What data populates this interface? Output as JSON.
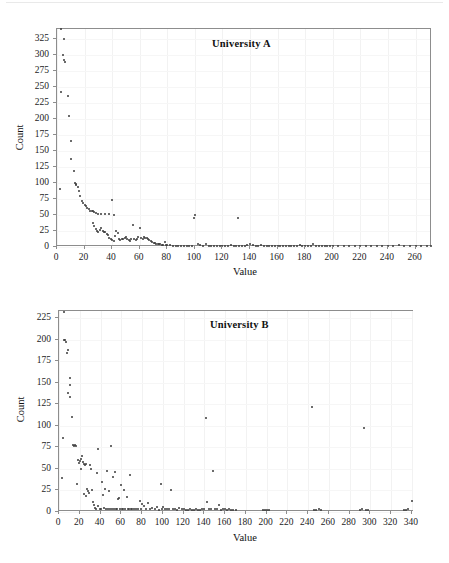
{
  "page": {
    "background": "#ffffff",
    "top_rule": "",
    "bottom_caption": ""
  },
  "chart_data": [
    {
      "id": "university-a",
      "type": "scatter",
      "title": "University A",
      "xlabel": "Value",
      "ylabel": "Count",
      "xlim": [
        0,
        272
      ],
      "ylim": [
        0,
        340
      ],
      "xticks": [
        0,
        20,
        40,
        60,
        80,
        100,
        120,
        140,
        160,
        180,
        200,
        220,
        240,
        260
      ],
      "yticks": [
        0,
        25,
        50,
        75,
        100,
        125,
        150,
        175,
        200,
        225,
        250,
        275,
        300,
        325
      ],
      "grid": "faint",
      "legend": "none",
      "marker_color": "#3a3a3a",
      "points": [
        [
          2,
          90
        ],
        [
          3,
          340
        ],
        [
          5,
          325
        ],
        [
          4,
          300
        ],
        [
          5,
          292
        ],
        [
          6,
          288
        ],
        [
          3,
          242
        ],
        [
          8,
          235
        ],
        [
          9,
          204
        ],
        [
          10,
          166
        ],
        [
          10,
          138
        ],
        [
          12,
          119
        ],
        [
          13,
          100
        ],
        [
          14,
          99
        ],
        [
          14,
          96
        ],
        [
          15,
          93
        ],
        [
          16,
          88
        ],
        [
          17,
          79
        ],
        [
          18,
          72
        ],
        [
          19,
          68
        ],
        [
          20,
          66
        ],
        [
          21,
          64
        ],
        [
          22,
          61
        ],
        [
          23,
          59
        ],
        [
          24,
          57
        ],
        [
          25,
          56
        ],
        [
          26,
          56
        ],
        [
          27,
          55
        ],
        [
          28,
          53
        ],
        [
          30,
          51
        ],
        [
          32,
          51
        ],
        [
          35,
          51
        ],
        [
          38,
          51
        ],
        [
          40,
          73
        ],
        [
          41,
          50
        ],
        [
          26,
          38
        ],
        [
          27,
          33
        ],
        [
          28,
          28
        ],
        [
          29,
          25
        ],
        [
          30,
          23
        ],
        [
          31,
          26
        ],
        [
          32,
          30
        ],
        [
          33,
          25
        ],
        [
          34,
          24
        ],
        [
          35,
          23
        ],
        [
          36,
          21
        ],
        [
          37,
          19
        ],
        [
          38,
          14
        ],
        [
          39,
          12
        ],
        [
          40,
          11
        ],
        [
          41,
          10
        ],
        [
          42,
          18
        ],
        [
          43,
          25
        ],
        [
          44,
          22
        ],
        [
          45,
          12
        ],
        [
          46,
          11
        ],
        [
          47,
          13
        ],
        [
          48,
          12
        ],
        [
          49,
          14
        ],
        [
          50,
          15
        ],
        [
          51,
          13
        ],
        [
          52,
          11
        ],
        [
          53,
          10
        ],
        [
          54,
          13
        ],
        [
          55,
          34
        ],
        [
          56,
          12
        ],
        [
          57,
          11
        ],
        [
          58,
          13
        ],
        [
          59,
          15
        ],
        [
          60,
          29
        ],
        [
          61,
          14
        ],
        [
          62,
          13
        ],
        [
          63,
          15
        ],
        [
          64,
          14
        ],
        [
          65,
          14
        ],
        [
          66,
          12
        ],
        [
          67,
          11
        ],
        [
          68,
          9
        ],
        [
          69,
          8
        ],
        [
          70,
          7
        ],
        [
          71,
          6
        ],
        [
          72,
          5
        ],
        [
          73,
          5
        ],
        [
          74,
          4
        ],
        [
          75,
          4
        ],
        [
          76,
          3
        ],
        [
          77,
          3
        ],
        [
          78,
          8
        ],
        [
          79,
          3
        ],
        [
          80,
          3
        ],
        [
          82,
          3
        ],
        [
          84,
          2
        ],
        [
          86,
          2
        ],
        [
          88,
          2
        ],
        [
          90,
          2
        ],
        [
          92,
          2
        ],
        [
          94,
          2
        ],
        [
          96,
          2
        ],
        [
          98,
          2
        ],
        [
          99,
          45
        ],
        [
          100,
          50
        ],
        [
          102,
          5
        ],
        [
          104,
          3
        ],
        [
          106,
          2
        ],
        [
          108,
          5
        ],
        [
          110,
          2
        ],
        [
          112,
          2
        ],
        [
          114,
          2
        ],
        [
          116,
          2
        ],
        [
          118,
          2
        ],
        [
          120,
          2
        ],
        [
          122,
          2
        ],
        [
          124,
          2
        ],
        [
          126,
          3
        ],
        [
          128,
          2
        ],
        [
          130,
          2
        ],
        [
          131,
          45
        ],
        [
          132,
          2
        ],
        [
          134,
          2
        ],
        [
          136,
          2
        ],
        [
          138,
          3
        ],
        [
          140,
          4
        ],
        [
          142,
          3
        ],
        [
          144,
          2
        ],
        [
          146,
          2
        ],
        [
          148,
          3
        ],
        [
          150,
          2
        ],
        [
          152,
          2
        ],
        [
          154,
          2
        ],
        [
          156,
          2
        ],
        [
          158,
          2
        ],
        [
          160,
          2
        ],
        [
          162,
          2
        ],
        [
          164,
          2
        ],
        [
          166,
          2
        ],
        [
          168,
          2
        ],
        [
          170,
          2
        ],
        [
          172,
          2
        ],
        [
          174,
          2
        ],
        [
          176,
          3
        ],
        [
          178,
          2
        ],
        [
          180,
          2
        ],
        [
          182,
          2
        ],
        [
          184,
          2
        ],
        [
          186,
          5
        ],
        [
          188,
          2
        ],
        [
          190,
          2
        ],
        [
          192,
          2
        ],
        [
          194,
          2
        ],
        [
          196,
          2
        ],
        [
          198,
          2
        ],
        [
          200,
          2
        ],
        [
          204,
          2
        ],
        [
          208,
          2
        ],
        [
          212,
          2
        ],
        [
          216,
          2
        ],
        [
          220,
          2
        ],
        [
          224,
          2
        ],
        [
          228,
          2
        ],
        [
          232,
          2
        ],
        [
          236,
          2
        ],
        [
          240,
          2
        ],
        [
          244,
          2
        ],
        [
          248,
          3
        ],
        [
          252,
          2
        ],
        [
          256,
          2
        ],
        [
          260,
          2
        ],
        [
          264,
          2
        ],
        [
          268,
          2
        ],
        [
          271,
          2
        ]
      ]
    },
    {
      "id": "university-b",
      "type": "scatter",
      "title": "University B",
      "xlabel": "Value",
      "ylabel": "Count",
      "xlim": [
        0,
        342
      ],
      "ylim": [
        0,
        233
      ],
      "xticks": [
        0,
        20,
        40,
        60,
        80,
        100,
        120,
        140,
        160,
        180,
        200,
        220,
        240,
        260,
        280,
        300,
        320,
        340
      ],
      "yticks": [
        0,
        25,
        50,
        75,
        100,
        125,
        150,
        175,
        200,
        225
      ],
      "grid": "faint",
      "legend": "none",
      "marker_color": "#3a3a3a",
      "points": [
        [
          3,
          40
        ],
        [
          4,
          86
        ],
        [
          5,
          232
        ],
        [
          5,
          200
        ],
        [
          6,
          199
        ],
        [
          7,
          197
        ],
        [
          8,
          184
        ],
        [
          9,
          188
        ],
        [
          9,
          138
        ],
        [
          11,
          155
        ],
        [
          11,
          147
        ],
        [
          11,
          133
        ],
        [
          12,
          110
        ],
        [
          13,
          78
        ],
        [
          14,
          77
        ],
        [
          15,
          78
        ],
        [
          16,
          76
        ],
        [
          17,
          33
        ],
        [
          18,
          60
        ],
        [
          19,
          57
        ],
        [
          20,
          59
        ],
        [
          21,
          62
        ],
        [
          21,
          50
        ],
        [
          22,
          65
        ],
        [
          23,
          58
        ],
        [
          24,
          56
        ],
        [
          24,
          21
        ],
        [
          25,
          55
        ],
        [
          26,
          56
        ],
        [
          26,
          19
        ],
        [
          27,
          27
        ],
        [
          28,
          24
        ],
        [
          29,
          22
        ],
        [
          30,
          55
        ],
        [
          31,
          50
        ],
        [
          32,
          26
        ],
        [
          33,
          12
        ],
        [
          34,
          8
        ],
        [
          35,
          5
        ],
        [
          36,
          3
        ],
        [
          37,
          45
        ],
        [
          38,
          73
        ],
        [
          38,
          7
        ],
        [
          39,
          4
        ],
        [
          40,
          4
        ],
        [
          41,
          35
        ],
        [
          42,
          20
        ],
        [
          43,
          5
        ],
        [
          44,
          27
        ],
        [
          45,
          4
        ],
        [
          46,
          48
        ],
        [
          47,
          4
        ],
        [
          48,
          24
        ],
        [
          49,
          4
        ],
        [
          50,
          77
        ],
        [
          51,
          3
        ],
        [
          52,
          41
        ],
        [
          53,
          3
        ],
        [
          54,
          47
        ],
        [
          55,
          3
        ],
        [
          56,
          4
        ],
        [
          57,
          15
        ],
        [
          58,
          16
        ],
        [
          59,
          4
        ],
        [
          60,
          31
        ],
        [
          61,
          3
        ],
        [
          62,
          3
        ],
        [
          63,
          25
        ],
        [
          64,
          3
        ],
        [
          65,
          18
        ],
        [
          66,
          3
        ],
        [
          67,
          3
        ],
        [
          68,
          43
        ],
        [
          69,
          3
        ],
        [
          70,
          3
        ],
        [
          72,
          4
        ],
        [
          74,
          3
        ],
        [
          76,
          3
        ],
        [
          78,
          13
        ],
        [
          79,
          3
        ],
        [
          80,
          9
        ],
        [
          82,
          7
        ],
        [
          84,
          3
        ],
        [
          86,
          10
        ],
        [
          88,
          3
        ],
        [
          90,
          5
        ],
        [
          92,
          3
        ],
        [
          94,
          6
        ],
        [
          96,
          2
        ],
        [
          98,
          32
        ],
        [
          99,
          3
        ],
        [
          100,
          6
        ],
        [
          102,
          3
        ],
        [
          104,
          3
        ],
        [
          106,
          4
        ],
        [
          108,
          26
        ],
        [
          110,
          3
        ],
        [
          112,
          3
        ],
        [
          114,
          2
        ],
        [
          116,
          5
        ],
        [
          118,
          3
        ],
        [
          120,
          3
        ],
        [
          122,
          2
        ],
        [
          124,
          2
        ],
        [
          126,
          3
        ],
        [
          128,
          2
        ],
        [
          130,
          2
        ],
        [
          132,
          3
        ],
        [
          134,
          2
        ],
        [
          136,
          2
        ],
        [
          138,
          4
        ],
        [
          140,
          3
        ],
        [
          142,
          109
        ],
        [
          143,
          12
        ],
        [
          144,
          3
        ],
        [
          146,
          3
        ],
        [
          148,
          48
        ],
        [
          150,
          4
        ],
        [
          152,
          3
        ],
        [
          154,
          8
        ],
        [
          156,
          2
        ],
        [
          158,
          3
        ],
        [
          160,
          4
        ],
        [
          162,
          2
        ],
        [
          164,
          3
        ],
        [
          166,
          2
        ],
        [
          168,
          2
        ],
        [
          170,
          2
        ],
        [
          196,
          2
        ],
        [
          198,
          2
        ],
        [
          200,
          2
        ],
        [
          202,
          2
        ],
        [
          244,
          122
        ],
        [
          246,
          2
        ],
        [
          248,
          2
        ],
        [
          250,
          3
        ],
        [
          252,
          2
        ],
        [
          290,
          2
        ],
        [
          292,
          3
        ],
        [
          294,
          97
        ],
        [
          296,
          2
        ],
        [
          298,
          2
        ],
        [
          332,
          2
        ],
        [
          334,
          2
        ],
        [
          336,
          3
        ],
        [
          340,
          13
        ]
      ]
    }
  ]
}
